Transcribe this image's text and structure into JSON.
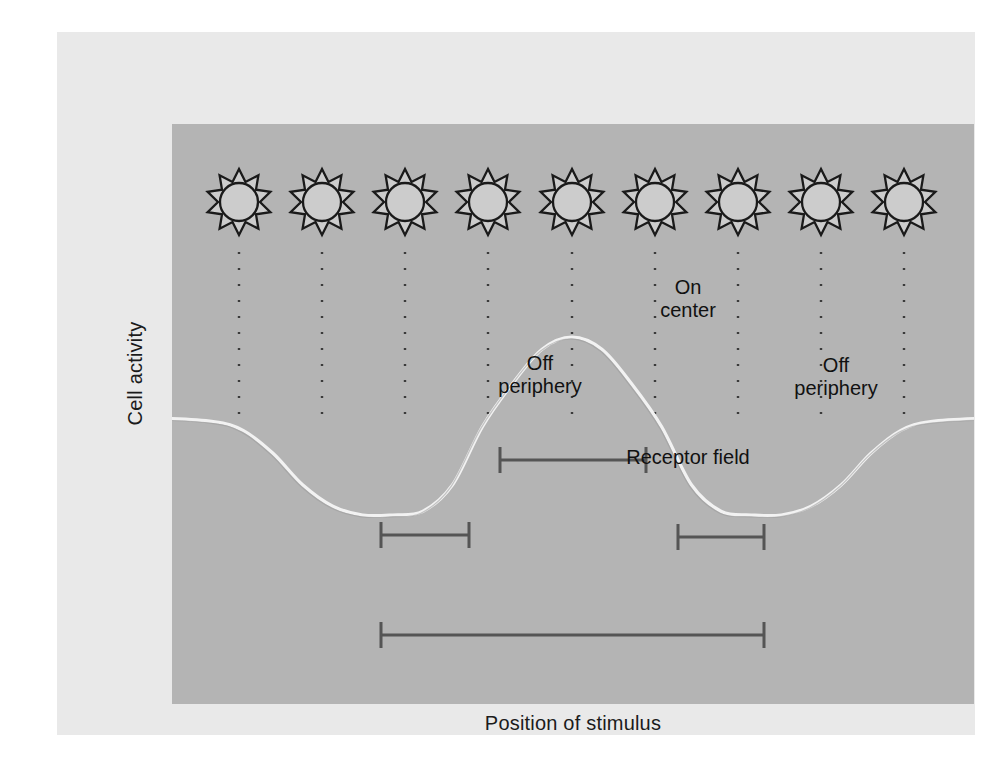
{
  "figure": {
    "axes": {
      "y_label": "Cell activity",
      "x_label": "Position of stimulus"
    },
    "annotations": {
      "on_center": "On\ncenter",
      "off_periphery_left": "Off\nperiphery",
      "off_periphery_right": "Off\nperiphery",
      "receptor_field": "Receptor field"
    },
    "colors": {
      "page_background": "#ffffff",
      "outer_panel": "#e9e9e9",
      "plot_field": "#b4b4b4",
      "curve": "#f2f2f2",
      "bracket": "#555555",
      "dotted_line": "#3a3a3a",
      "stimulus_outline": "#1a1a1a",
      "stimulus_fill": "#cccccc",
      "text": "#141414"
    },
    "stimuli": {
      "icon": "sun-icon",
      "count": 9,
      "points_per_star": 10,
      "centers_x": [
        182,
        265,
        348,
        431,
        515,
        598,
        681,
        764,
        847
      ],
      "center_y": 170,
      "outer_radius": 33,
      "inner_radius": 21,
      "circle_radius": 19,
      "dotted_line_top": 220,
      "dotted_line_bottom": 386
    },
    "brackets": [
      {
        "name": "on-center",
        "x1": 443,
        "x2": 589,
        "y": 428,
        "label": "On\ncenter"
      },
      {
        "name": "off-periphery-left",
        "x1": 324,
        "x2": 412,
        "y": 503,
        "label": "Off\nperiphery"
      },
      {
        "name": "off-periphery-right",
        "x1": 621,
        "x2": 707,
        "y": 505,
        "label": "Off\nperiphery"
      },
      {
        "name": "receptor-field",
        "x1": 324,
        "x2": 707,
        "y": 603,
        "label": "Receptor field"
      }
    ]
  },
  "chart_data": {
    "type": "line",
    "xlabel": "Position of stimulus",
    "ylabel": "Cell activity",
    "grid": false,
    "legend": "none",
    "baseline": 0,
    "peak_value": 1.0,
    "trough_value": -0.55,
    "peak_position": 0,
    "trough_positions": [
      -1.0,
      1.0
    ],
    "x": [
      -4.0,
      -3.6,
      -3.2,
      -2.8,
      -2.4,
      -2.2,
      -2.0,
      -1.8,
      -1.6,
      -1.4,
      -1.2,
      -1.0,
      -0.8,
      -0.6,
      -0.4,
      -0.2,
      0.0,
      0.2,
      0.4,
      0.6,
      0.8,
      1.0,
      1.2,
      1.4,
      1.6,
      1.8,
      2.0,
      2.2,
      2.4,
      2.8,
      3.2,
      3.6,
      4.0
    ],
    "y": [
      0.0,
      0.0,
      0.0,
      0.0,
      -0.02,
      -0.07,
      -0.2,
      -0.38,
      -0.5,
      -0.55,
      -0.55,
      -0.53,
      -0.38,
      -0.05,
      0.42,
      0.85,
      1.0,
      0.85,
      0.42,
      -0.05,
      -0.38,
      -0.53,
      -0.55,
      -0.55,
      -0.5,
      -0.38,
      -0.2,
      -0.07,
      -0.02,
      0.0,
      0.0,
      0.0,
      0.0
    ],
    "xlim": [
      -4.0,
      4.0
    ],
    "ylim": [
      -0.75,
      1.2
    ],
    "regions": [
      {
        "name": "On center",
        "x_start": -0.45,
        "x_end": 0.45
      },
      {
        "name": "Off periphery",
        "x_start": -1.55,
        "x_end": -0.62
      },
      {
        "name": "Off periphery",
        "x_start": 0.62,
        "x_end": 1.55
      },
      {
        "name": "Receptor field",
        "x_start": -1.55,
        "x_end": 1.55
      }
    ]
  }
}
